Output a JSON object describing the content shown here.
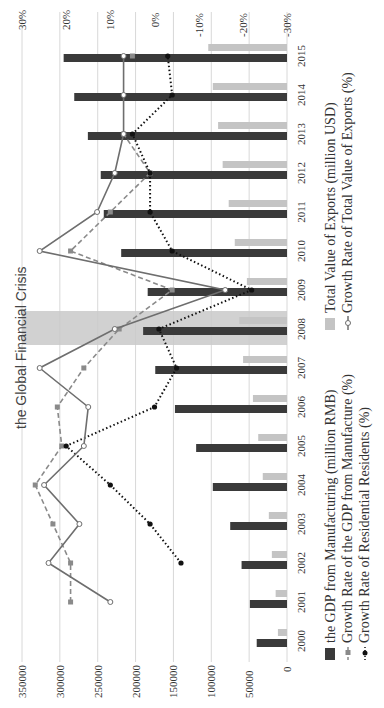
{
  "chart_data": {
    "type": "bar",
    "orientation": "rotated-90-clockwise",
    "title": "",
    "categories": [
      "2000",
      "2001",
      "2002",
      "2003",
      "2004",
      "2005",
      "2006",
      "2007",
      "2008",
      "2009",
      "2010",
      "2011",
      "2012",
      "2013",
      "2014",
      "2015"
    ],
    "left_axis": {
      "label": "",
      "ticks": [
        "0",
        "50000",
        "100000",
        "150000",
        "200000",
        "250000",
        "300000",
        "350000"
      ],
      "range": [
        0,
        350000
      ]
    },
    "right_axis": {
      "label": "",
      "ticks": [
        "-30%",
        "-20%",
        "-10%",
        "0%",
        "10%",
        "20%",
        "30%"
      ],
      "range": [
        -30,
        30
      ]
    },
    "grid": true,
    "series": [
      {
        "name": "the GDP from Manufacturing (million RMB)",
        "type": "bar",
        "axis": "left",
        "color": "#3a3a3a",
        "values": [
          40000,
          49000,
          60000,
          75000,
          98000,
          120000,
          148000,
          174000,
          190000,
          184000,
          219000,
          242000,
          246000,
          263000,
          281000,
          295000
        ]
      },
      {
        "name": "Total Value of Exports (million USD)",
        "type": "bar",
        "axis": "left",
        "color": "#c4c4c4",
        "values": [
          12000,
          15000,
          20000,
          24000,
          32000,
          38000,
          45000,
          58000,
          63000,
          53000,
          69000,
          77000,
          85000,
          91000,
          98000,
          104000
        ]
      },
      {
        "name": "Growth Rate of the GDP from Manufacture (%)",
        "type": "line",
        "axis": "right",
        "color": "#8a8a8a",
        "style": "dashed",
        "marker": "square",
        "values": [
          null,
          19,
          19,
          23,
          27,
          21,
          22,
          16,
          8,
          -4,
          19,
          10,
          1,
          7,
          null,
          5
        ]
      },
      {
        "name": "Growth Rate of Residential Residents (%)",
        "type": "line",
        "axis": "right",
        "color": "#111111",
        "style": "dotted",
        "marker": "circle-filled",
        "values": [
          null,
          null,
          -6,
          1,
          10,
          20,
          0,
          -5,
          -1,
          -22,
          -4,
          1,
          1,
          5,
          -4,
          -3
        ]
      },
      {
        "name": "Growth Rate of Total Value of Exports (%)",
        "type": "line",
        "axis": "right",
        "color": "#6e6e6e",
        "style": "solid",
        "marker": "circle-open",
        "values": [
          null,
          10,
          24,
          17,
          25,
          16,
          15,
          26,
          9,
          -16,
          26,
          13,
          9,
          7,
          7,
          7
        ]
      }
    ],
    "annotations": [
      {
        "text": "the Global Financial Crisis",
        "category": "2008",
        "shaded": true
      }
    ],
    "legend": {
      "position": "bottom (rotated: right side)",
      "items": [
        "the GDP from Manufacturing (million RMB)",
        "Growth Rate of the GDP from Manufacture (%)",
        "Growth Rate of Residential Residents (%)",
        "Total Value of Exports (million USD)",
        "Growth Rate of Total Value of Exports (%)"
      ]
    }
  },
  "labels": {
    "crisis": "the Global Financial Crisis",
    "legend": {
      "gdp": "the GDP from Manufacturing (million RMB)",
      "gdp_growth": "Growth Rate of the GDP from Manufacture  (%)",
      "res_growth": "Growth Rate of Residential Residents  (%)",
      "exports": "Total Value of  Exports  (million USD)",
      "exp_growth": "Growth Rate of Total Value of  Exports  (%)"
    }
  }
}
